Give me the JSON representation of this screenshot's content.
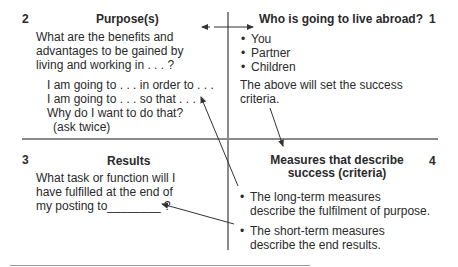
{
  "quadrants": {
    "q2": {
      "number": "2",
      "title": "Purpose(s)",
      "question_lines": [
        "What are the benefits and",
        "advantages to be gained by",
        "living and working in . . . ?"
      ],
      "prompt_lines": [
        "I am going to . . . in order to . . .",
        "I am going to . . . so that . . .",
        "Why do I want to do that?",
        "(ask twice)"
      ]
    },
    "q1": {
      "number": "1",
      "title": "Who is going to live abroad?",
      "bullets": [
        "You",
        "Partner",
        "Children"
      ],
      "note_lines": [
        "The above will set the success",
        "criteria."
      ]
    },
    "q3": {
      "number": "3",
      "title": "Results",
      "question_lines": [
        "What task or function will I",
        "have fulfilled at the end of",
        "my posting to________ ?"
      ]
    },
    "q4": {
      "number": "4",
      "title_lines": [
        "Measures that describe",
        "success (criteria)"
      ],
      "bullets": [
        {
          "line1": "The long-term measures",
          "line2": "describe the fulfilment of purpose."
        },
        {
          "line1": "The short-term measures",
          "line2": "describe the end results."
        }
      ]
    }
  },
  "colors": {
    "axis": "#8a8a8a",
    "text": "#2a2a2a",
    "arrow": "#333333"
  }
}
